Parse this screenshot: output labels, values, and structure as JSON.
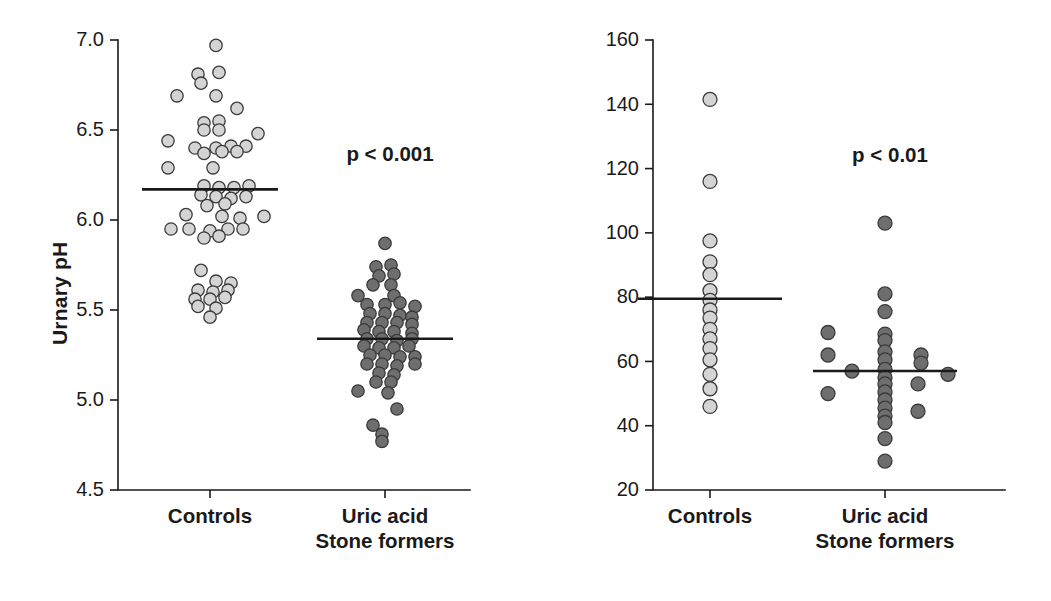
{
  "figure": {
    "background_color": "#ffffff",
    "panel_count": 2
  },
  "chart_data": [
    {
      "type": "scatter",
      "panel": "left",
      "title": "",
      "xlabel": "",
      "ylabel": "Urnary pH",
      "ylim": [
        4.5,
        7.0
      ],
      "yticks": [
        4.5,
        5.0,
        5.5,
        6.0,
        6.5,
        7.0
      ],
      "ytick_labels": [
        "4.5",
        "5.0",
        "5.5",
        "6.0",
        "6.5",
        "7.0"
      ],
      "grid": false,
      "legend": "none",
      "annotations": [
        {
          "text": "p < 0.001",
          "x_category": "between",
          "y": 6.33
        }
      ],
      "categories": [
        "Controls",
        "Uric acid Stone formers"
      ],
      "series": [
        {
          "name": "Controls",
          "marker_fill": "#d4d4d4",
          "marker_edge": "#3a3a3a",
          "mean": 6.17,
          "n": 62,
          "points": [
            {
              "x": 0.02,
              "y": 6.97
            },
            {
              "x": -0.04,
              "y": 6.81
            },
            {
              "x": 0.03,
              "y": 6.82
            },
            {
              "x": -0.03,
              "y": 6.76
            },
            {
              "x": -0.11,
              "y": 6.69
            },
            {
              "x": 0.02,
              "y": 6.69
            },
            {
              "x": 0.09,
              "y": 6.62
            },
            {
              "x": -0.02,
              "y": 6.54
            },
            {
              "x": 0.03,
              "y": 6.55
            },
            {
              "x": -0.02,
              "y": 6.5
            },
            {
              "x": 0.03,
              "y": 6.5
            },
            {
              "x": 0.16,
              "y": 6.48
            },
            {
              "x": -0.14,
              "y": 6.44
            },
            {
              "x": -0.05,
              "y": 6.4
            },
            {
              "x": 0.02,
              "y": 6.4
            },
            {
              "x": 0.07,
              "y": 6.41
            },
            {
              "x": 0.12,
              "y": 6.41
            },
            {
              "x": -0.02,
              "y": 6.37
            },
            {
              "x": 0.04,
              "y": 6.38
            },
            {
              "x": 0.09,
              "y": 6.38
            },
            {
              "x": -0.14,
              "y": 6.29
            },
            {
              "x": 0.01,
              "y": 6.29
            },
            {
              "x": -0.02,
              "y": 6.19
            },
            {
              "x": 0.03,
              "y": 6.18
            },
            {
              "x": 0.08,
              "y": 6.18
            },
            {
              "x": 0.13,
              "y": 6.19
            },
            {
              "x": -0.03,
              "y": 6.14
            },
            {
              "x": 0.02,
              "y": 6.13
            },
            {
              "x": 0.07,
              "y": 6.12
            },
            {
              "x": 0.12,
              "y": 6.13
            },
            {
              "x": -0.01,
              "y": 6.08
            },
            {
              "x": 0.05,
              "y": 6.09
            },
            {
              "x": -0.08,
              "y": 6.03
            },
            {
              "x": 0.04,
              "y": 6.02
            },
            {
              "x": 0.1,
              "y": 6.01
            },
            {
              "x": 0.18,
              "y": 6.02
            },
            {
              "x": -0.13,
              "y": 5.95
            },
            {
              "x": -0.07,
              "y": 5.95
            },
            {
              "x": 0.0,
              "y": 5.94
            },
            {
              "x": 0.06,
              "y": 5.95
            },
            {
              "x": 0.11,
              "y": 5.95
            },
            {
              "x": -0.02,
              "y": 5.9
            },
            {
              "x": 0.03,
              "y": 5.91
            },
            {
              "x": -0.03,
              "y": 5.72
            },
            {
              "x": 0.02,
              "y": 5.66
            },
            {
              "x": 0.07,
              "y": 5.65
            },
            {
              "x": -0.04,
              "y": 5.61
            },
            {
              "x": 0.01,
              "y": 5.6
            },
            {
              "x": 0.06,
              "y": 5.61
            },
            {
              "x": -0.05,
              "y": 5.56
            },
            {
              "x": 0.0,
              "y": 5.56
            },
            {
              "x": 0.05,
              "y": 5.57
            },
            {
              "x": -0.04,
              "y": 5.52
            },
            {
              "x": 0.02,
              "y": 5.51
            },
            {
              "x": 0.0,
              "y": 5.46
            }
          ]
        },
        {
          "name": "Uric acid Stone formers",
          "marker_fill": "#6e6e6e",
          "marker_edge": "#2a2a2a",
          "mean": 5.34,
          "n": 72,
          "points": [
            {
              "x": 0.0,
              "y": 5.87
            },
            {
              "x": -0.03,
              "y": 5.74
            },
            {
              "x": 0.02,
              "y": 5.75
            },
            {
              "x": -0.02,
              "y": 5.69
            },
            {
              "x": 0.03,
              "y": 5.7
            },
            {
              "x": -0.04,
              "y": 5.64
            },
            {
              "x": 0.02,
              "y": 5.64
            },
            {
              "x": -0.09,
              "y": 5.58
            },
            {
              "x": 0.03,
              "y": 5.58
            },
            {
              "x": -0.06,
              "y": 5.53
            },
            {
              "x": 0.0,
              "y": 5.53
            },
            {
              "x": 0.05,
              "y": 5.54
            },
            {
              "x": 0.1,
              "y": 5.52
            },
            {
              "x": -0.05,
              "y": 5.48
            },
            {
              "x": 0.0,
              "y": 5.48
            },
            {
              "x": 0.05,
              "y": 5.47
            },
            {
              "x": 0.09,
              "y": 5.46
            },
            {
              "x": -0.06,
              "y": 5.43
            },
            {
              "x": -0.01,
              "y": 5.43
            },
            {
              "x": 0.04,
              "y": 5.43
            },
            {
              "x": 0.09,
              "y": 5.42
            },
            {
              "x": -0.07,
              "y": 5.39
            },
            {
              "x": -0.02,
              "y": 5.38
            },
            {
              "x": 0.03,
              "y": 5.38
            },
            {
              "x": 0.09,
              "y": 5.37
            },
            {
              "x": -0.06,
              "y": 5.34
            },
            {
              "x": -0.01,
              "y": 5.34
            },
            {
              "x": 0.04,
              "y": 5.33
            },
            {
              "x": 0.09,
              "y": 5.34
            },
            {
              "x": -0.07,
              "y": 5.3
            },
            {
              "x": -0.02,
              "y": 5.29
            },
            {
              "x": 0.03,
              "y": 5.29
            },
            {
              "x": 0.08,
              "y": 5.3
            },
            {
              "x": -0.05,
              "y": 5.25
            },
            {
              "x": 0.0,
              "y": 5.25
            },
            {
              "x": 0.05,
              "y": 5.24
            },
            {
              "x": 0.1,
              "y": 5.24
            },
            {
              "x": -0.06,
              "y": 5.2
            },
            {
              "x": -0.01,
              "y": 5.2
            },
            {
              "x": 0.04,
              "y": 5.19
            },
            {
              "x": 0.1,
              "y": 5.2
            },
            {
              "x": -0.02,
              "y": 5.15
            },
            {
              "x": 0.03,
              "y": 5.14
            },
            {
              "x": -0.03,
              "y": 5.1
            },
            {
              "x": 0.02,
              "y": 5.1
            },
            {
              "x": -0.09,
              "y": 5.05
            },
            {
              "x": 0.01,
              "y": 5.04
            },
            {
              "x": 0.04,
              "y": 4.95
            },
            {
              "x": -0.04,
              "y": 4.86
            },
            {
              "x": -0.01,
              "y": 4.81
            },
            {
              "x": -0.01,
              "y": 4.77
            }
          ]
        }
      ]
    },
    {
      "type": "scatter",
      "panel": "right",
      "title": "",
      "xlabel": "",
      "ylabel": "NH4+/Net acid excretion (%)",
      "ylim": [
        20,
        160
      ],
      "yticks": [
        20,
        40,
        60,
        80,
        100,
        120,
        140,
        160
      ],
      "ytick_labels": [
        "20",
        "40",
        "60",
        "80",
        "100",
        "120",
        "140",
        "160"
      ],
      "grid": false,
      "legend": "none",
      "annotations": [
        {
          "text": "p < 0.01",
          "x_category": "between",
          "y": 122
        }
      ],
      "categories": [
        "Controls",
        "Uric acid Stone formers"
      ],
      "series": [
        {
          "name": "Controls",
          "marker_fill": "#d4d4d4",
          "marker_edge": "#3a3a3a",
          "mean": 79.5,
          "n": 17,
          "points": [
            {
              "x": 0.0,
              "y": 141.5
            },
            {
              "x": 0.0,
              "y": 116.0
            },
            {
              "x": 0.0,
              "y": 97.5
            },
            {
              "x": 0.0,
              "y": 91.0
            },
            {
              "x": 0.0,
              "y": 87.0
            },
            {
              "x": 0.0,
              "y": 82.0
            },
            {
              "x": 0.0,
              "y": 79.0
            },
            {
              "x": 0.0,
              "y": 76.0
            },
            {
              "x": 0.0,
              "y": 73.5
            },
            {
              "x": 0.0,
              "y": 70.0
            },
            {
              "x": 0.0,
              "y": 67.0
            },
            {
              "x": 0.0,
              "y": 64.0
            },
            {
              "x": 0.0,
              "y": 60.5
            },
            {
              "x": 0.0,
              "y": 56.0
            },
            {
              "x": 0.0,
              "y": 51.5
            },
            {
              "x": 0.0,
              "y": 46.0
            }
          ]
        },
        {
          "name": "Uric acid Stone formers",
          "marker_fill": "#6e6e6e",
          "marker_edge": "#2a2a2a",
          "mean": 57.0,
          "n": 27,
          "points": [
            {
              "x": 0.0,
              "y": 103.0
            },
            {
              "x": 0.0,
              "y": 81.0
            },
            {
              "x": 0.0,
              "y": 75.5
            },
            {
              "x": 0.0,
              "y": 68.5
            },
            {
              "x": 0.0,
              "y": 66.5
            },
            {
              "x": -0.19,
              "y": 69.0
            },
            {
              "x": -0.19,
              "y": 62.0
            },
            {
              "x": 0.0,
              "y": 63.0
            },
            {
              "x": 0.12,
              "y": 62.0
            },
            {
              "x": 0.0,
              "y": 60.5
            },
            {
              "x": 0.12,
              "y": 59.5
            },
            {
              "x": -0.11,
              "y": 57.0
            },
            {
              "x": 0.0,
              "y": 57.5
            },
            {
              "x": 0.21,
              "y": 56.0
            },
            {
              "x": 0.0,
              "y": 55.0
            },
            {
              "x": 0.0,
              "y": 53.0
            },
            {
              "x": 0.11,
              "y": 53.0
            },
            {
              "x": -0.19,
              "y": 50.0
            },
            {
              "x": 0.0,
              "y": 50.5
            },
            {
              "x": 0.0,
              "y": 48.0
            },
            {
              "x": 0.0,
              "y": 45.5
            },
            {
              "x": 0.11,
              "y": 44.5
            },
            {
              "x": 0.0,
              "y": 43.0
            },
            {
              "x": 0.0,
              "y": 41.0
            },
            {
              "x": 0.0,
              "y": 36.0
            },
            {
              "x": 0.0,
              "y": 29.0
            }
          ]
        }
      ]
    }
  ],
  "panels": {
    "left": {
      "y_axis_title": "Urnary pH",
      "pvalue": "p < 0.001",
      "category_labels": [
        {
          "line1": "Controls",
          "line2": ""
        },
        {
          "line1": "Uric acid",
          "line2": "Stone formers"
        }
      ]
    },
    "right": {
      "y_axis_title_prefix": "NH",
      "y_axis_title_sub": "4",
      "y_axis_title_sup": "+",
      "y_axis_title_suffix": "/Net acid excretion (%)",
      "pvalue": "p < 0.01",
      "category_labels": [
        {
          "line1": "Controls",
          "line2": ""
        },
        {
          "line1": "Uric acid",
          "line2": "Stone formers"
        }
      ]
    }
  }
}
